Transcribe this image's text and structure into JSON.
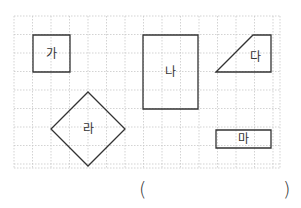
{
  "grid": {
    "x0": 14,
    "y0": 16,
    "cell": 18.5,
    "cols": 14.4,
    "rows": 8.2,
    "x_lines": [
      14,
      32.5,
      51,
      69.5,
      88,
      106.5,
      125,
      143.5,
      162,
      180.5,
      199,
      217.5,
      236,
      254.5,
      273,
      280
    ],
    "y_lines": [
      16,
      34.5,
      53,
      71.5,
      90,
      108.5,
      127,
      145.5,
      164,
      168
    ],
    "x_max": 280,
    "y_max": 168,
    "line_color": "#c8c8c8"
  },
  "stroke_color": "#333333",
  "label_color": "#333333",
  "shapes": [
    {
      "id": "ga",
      "label": "가",
      "type": "square",
      "points": "33,35 70,35 70,72 33,72",
      "label_x": 51.5,
      "label_y": 54
    },
    {
      "id": "na",
      "label": "나",
      "type": "rectangle",
      "points": "143,35 198,35 198,109 143,109",
      "label_x": 170.5,
      "label_y": 72
    },
    {
      "id": "da",
      "label": "다",
      "type": "trapezoid",
      "points": "216,72 253,35 271,35 271,72",
      "label_x": 255,
      "label_y": 57
    },
    {
      "id": "ra",
      "label": "라",
      "type": "rhombus",
      "points": "88,92 125,129 88,166 51,129",
      "label_x": 88,
      "label_y": 129
    },
    {
      "id": "ma",
      "label": "마",
      "type": "rectangle",
      "points": "216,130 271,130 271,148 216,148",
      "label_x": 243.5,
      "label_y": 139
    }
  ],
  "answer": {
    "open_paren": "(",
    "close_paren": ")",
    "value": ""
  }
}
